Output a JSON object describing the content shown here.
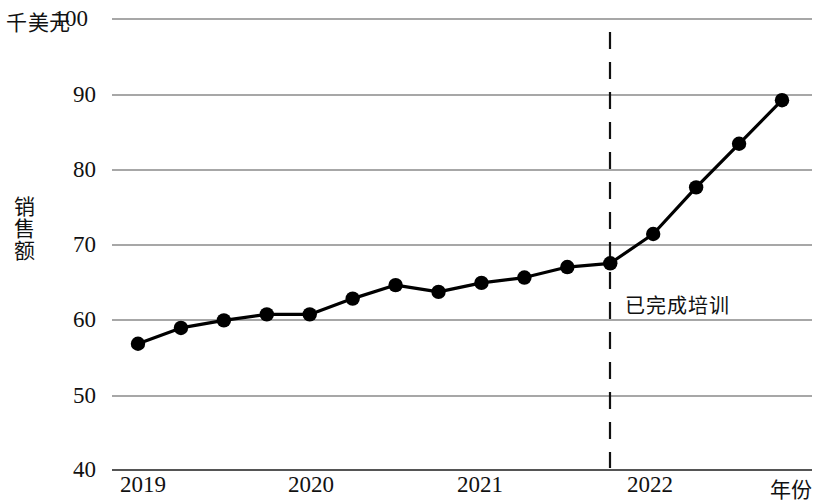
{
  "chart_data": {
    "type": "line",
    "title": "",
    "xlabel": "年份",
    "ylabel": "销售额",
    "unit_label": "千美元",
    "xlim": [
      2018.75,
      2023.0
    ],
    "ylim": [
      40,
      100
    ],
    "ytick_labels": [
      "40",
      "50",
      "60",
      "70",
      "80",
      "90",
      "100"
    ],
    "ytick_values": [
      40,
      50,
      60,
      70,
      80,
      90,
      100
    ],
    "xtick_labels": [
      "2019",
      "2020",
      "2021",
      "2022"
    ],
    "xtick_values": [
      2019,
      2020,
      2021,
      2022
    ],
    "grid": true,
    "legend": "none",
    "x": [
      2019.0,
      2019.25,
      2019.5,
      2019.75,
      2020.0,
      2020.25,
      2020.5,
      2020.75,
      2021.0,
      2021.25,
      2021.5,
      2021.75,
      2022.0,
      2022.25,
      2022.5,
      2022.75
    ],
    "values": [
      56.8,
      58.9,
      59.9,
      60.7,
      60.7,
      62.8,
      64.6,
      63.7,
      64.9,
      65.6,
      67.0,
      67.5,
      71.4,
      77.6,
      83.4,
      89.2
    ],
    "series": [
      {
        "name": "销售额",
        "values": [
          56.8,
          58.9,
          59.9,
          60.7,
          60.7,
          62.8,
          64.6,
          63.7,
          64.9,
          65.6,
          67.0,
          67.5,
          71.4,
          77.6,
          83.4,
          89.2
        ]
      }
    ],
    "annotations": [
      {
        "text": "已完成培训",
        "type": "vertical-dashed-line",
        "x": 2021.75,
        "label_y": 62.0
      }
    ],
    "colors": {
      "line": "#000000",
      "marker": "#000000",
      "grid": "#8a8a8a",
      "axis": "#555555",
      "background": "#ffffff"
    }
  }
}
